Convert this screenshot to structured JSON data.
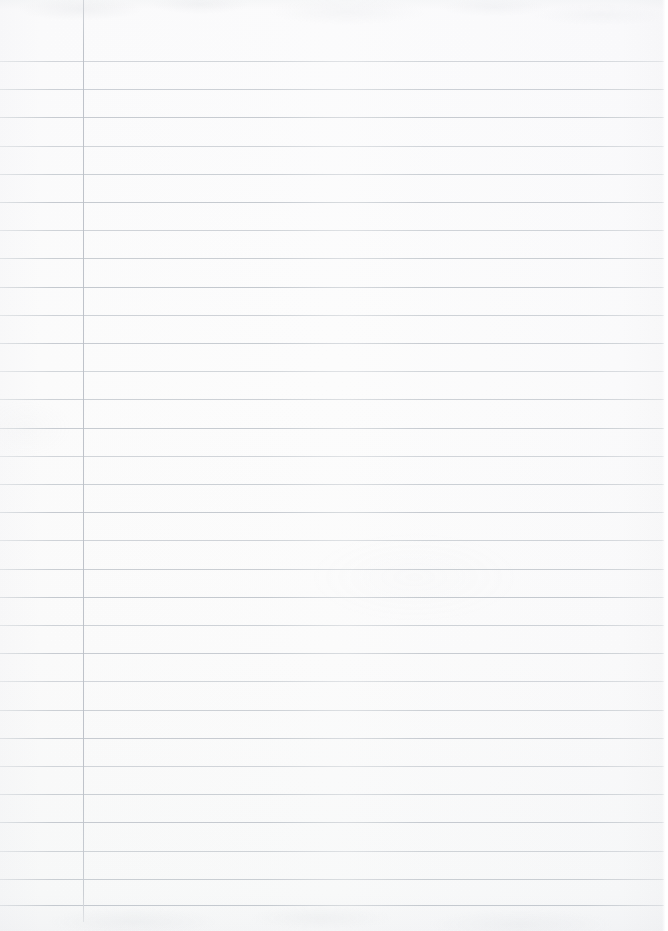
{
  "document": {
    "kind": "scanned-lined-notebook-page",
    "title": "Blank ruled notebook page",
    "content_text": "",
    "has_handwriting": false,
    "has_printed_text": false,
    "orientation": "portrait"
  },
  "page": {
    "width": 668,
    "height": 931,
    "background_color": "#fdfdfd",
    "paper_tint_top": "#f8f9fa",
    "paper_tint_bottom": "#f6f7f8"
  },
  "ruling": {
    "line_color": "#c3c8ce",
    "line_thickness": 1,
    "line_spacing": 28.1,
    "first_line_y": 61,
    "line_count": 31,
    "line_start_x": 0,
    "line_end_x": 664,
    "line_y_positions": [
      61,
      89,
      117,
      146,
      174,
      202,
      230,
      258,
      287,
      315,
      343,
      371,
      399,
      428,
      456,
      484,
      512,
      540,
      569,
      597,
      625,
      653,
      681,
      710,
      738,
      766,
      794,
      822,
      851,
      879,
      905
    ]
  },
  "margin_rule": {
    "color": "#bcc1c8",
    "x": 83,
    "thickness": 1,
    "top_y": 0,
    "bottom_y": 922,
    "orientation": "vertical"
  },
  "regions": {
    "left_gutter_label": "margin gutter",
    "writing_area_label": "writing area",
    "header_area_label": "unruled header area"
  }
}
